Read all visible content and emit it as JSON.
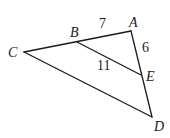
{
  "diagram": {
    "type": "geometry-triangle",
    "points": {
      "A": {
        "label": "A",
        "x": 131,
        "y": 31
      },
      "B": {
        "label": "B",
        "x": 77,
        "y": 42
      },
      "C": {
        "label": "C",
        "x": 24,
        "y": 52
      },
      "D": {
        "label": "D",
        "x": 152,
        "y": 117
      },
      "E": {
        "label": "E",
        "x": 141,
        "y": 75
      }
    },
    "segments": [
      {
        "from": "C",
        "to": "A"
      },
      {
        "from": "A",
        "to": "D"
      },
      {
        "from": "C",
        "to": "D"
      },
      {
        "from": "B",
        "to": "E"
      }
    ],
    "measures": {
      "AB": "7",
      "AE": "6",
      "BE": "11"
    }
  }
}
